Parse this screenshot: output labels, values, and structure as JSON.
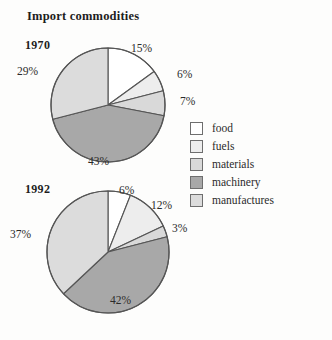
{
  "title": "Import commodities",
  "legend": {
    "position": "right",
    "items": [
      {
        "label": "food",
        "color": "#ffffff"
      },
      {
        "label": "fuels",
        "color": "#ededed"
      },
      {
        "label": "materials",
        "color": "#d9d9d9"
      },
      {
        "label": "machinery",
        "color": "#a8a8a8"
      },
      {
        "label": "manufactures",
        "color": "#dcdcdc"
      }
    ]
  },
  "chart_data": {
    "type": "pie",
    "title": "Import commodities",
    "xlabel": "",
    "ylabel": "",
    "grid": false,
    "legend_position": "right",
    "categories": [
      "food",
      "fuels",
      "materials",
      "machinery",
      "manufactures"
    ],
    "colors": [
      "#ffffff",
      "#ededed",
      "#d9d9d9",
      "#a8a8a8",
      "#dcdcdc"
    ],
    "charts": [
      {
        "name": "1970",
        "label": "1970",
        "start_angle_deg": 0,
        "direction": "clockwise",
        "values": [
          15,
          6,
          7,
          43,
          29
        ],
        "value_labels": [
          "15%",
          "6%",
          "7%",
          "43%",
          "29%"
        ]
      },
      {
        "name": "1992",
        "label": "1992",
        "start_angle_deg": 0,
        "direction": "clockwise",
        "values": [
          6,
          12,
          3,
          42,
          37
        ],
        "value_labels": [
          "6%",
          "12%",
          "3%",
          "42%",
          "37%"
        ]
      }
    ]
  },
  "pies": {
    "p1970": {
      "year": "1970",
      "food": "15%",
      "fuels": "6%",
      "materials": "7%",
      "machinery": "43%",
      "manufactures": "29%"
    },
    "p1992": {
      "year": "1992",
      "food": "6%",
      "fuels": "12%",
      "materials": "3%",
      "machinery": "42%",
      "manufactures": "37%"
    }
  }
}
